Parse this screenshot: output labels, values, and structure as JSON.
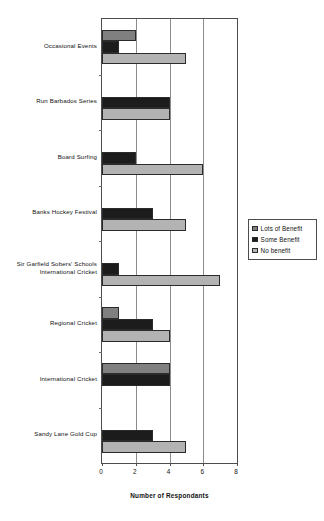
{
  "chart_data": {
    "type": "bar",
    "orientation": "horizontal",
    "title": "",
    "xlabel": "Number of Respondants",
    "ylabel": "",
    "xlim": [
      0,
      8
    ],
    "xticks": [
      0,
      2,
      4,
      6,
      8
    ],
    "xticklabels": [
      "0",
      "2",
      "4",
      "6",
      "8"
    ],
    "grid": true,
    "grid_axis": "x",
    "legend_position": "right",
    "category_order": "top-to-bottom",
    "categories": [
      "Occasional Events",
      "Run Barbados Series",
      "Board Surfing",
      "Banks Hockey Festival",
      "Sir Garfield Sobers' Schools International Cricket",
      "Regional Cricket",
      "International Cricket",
      "Sandy Lane Gold Cup"
    ],
    "category_label_lines": [
      [
        "Occasional Events"
      ],
      [
        "Run Barbados Series"
      ],
      [
        "Board Surfing"
      ],
      [
        "Banks Hockey Festival"
      ],
      [
        "Sir Garfield Sobers' Schools",
        "International Cricket"
      ],
      [
        "Regional Cricket"
      ],
      [
        "International Cricket"
      ],
      [
        "Sandy Lane Gold Cup"
      ]
    ],
    "series": [
      {
        "name": "Lots of Benefit",
        "color": "#808080",
        "values": [
          2,
          0,
          0,
          0,
          0,
          1,
          4,
          0
        ]
      },
      {
        "name": "Some Benefit",
        "color": "#1c1c1c",
        "values": [
          1,
          4,
          2,
          3,
          1,
          3,
          4,
          3
        ]
      },
      {
        "name": "No benefit",
        "color": "#b3b3b3",
        "values": [
          5,
          4,
          6,
          5,
          7,
          4,
          0,
          5
        ]
      }
    ]
  },
  "legend": {
    "items": [
      {
        "label": "Lots of Benefit",
        "color": "#808080"
      },
      {
        "label": "Some Benefit",
        "color": "#1c1c1c"
      },
      {
        "label": "No benefit",
        "color": "#b3b3b3"
      }
    ]
  },
  "axis": {
    "x_title": "Number of Respondants",
    "x_tick_labels": [
      "0",
      "2",
      "4",
      "6",
      "8"
    ]
  }
}
